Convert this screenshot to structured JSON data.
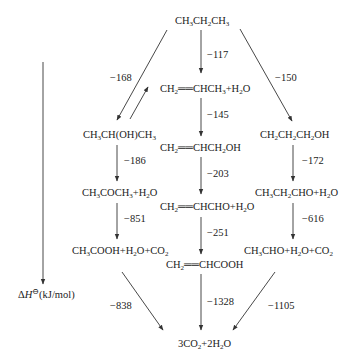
{
  "diagram": {
    "title": "",
    "axis_label": "ΔH⊖(kJ/mol)",
    "nodes": {
      "propane": "CH3CH2CH3",
      "propene": "CH2═CHCH3+H2O",
      "isopropanol": "CH3CH(OH)CH3",
      "allyl_alcohol": "CH2═CHCH2OH",
      "propanol": "CH2CH2CH2OH",
      "acetone": "CH3COCH3+H2O",
      "acrolein": "CH2═CHCHO+H2O",
      "propanal": "CH3CH2CHO+H2O",
      "acetic": "CH3COOH+H2O+CO2",
      "acrylic": "CH2═CHCOOH",
      "acetaldehyde": "CH3CHO+H2O+CO2",
      "final": "3CO2+2H2O"
    },
    "edges": [
      {
        "from": "propane",
        "to": "isopropanol",
        "value": "−168"
      },
      {
        "from": "propane",
        "to": "propene",
        "value": "−117"
      },
      {
        "from": "propane",
        "to": "propanol",
        "value": "−150"
      },
      {
        "from": "isopropanol",
        "to": "propene",
        "value": ""
      },
      {
        "from": "propene",
        "to": "allyl_alcohol",
        "value": "−145"
      },
      {
        "from": "isopropanol",
        "to": "acetone",
        "value": "−186"
      },
      {
        "from": "allyl_alcohol",
        "to": "acrolein",
        "value": "−203"
      },
      {
        "from": "propanol",
        "to": "propanal",
        "value": "−172"
      },
      {
        "from": "acetone",
        "to": "acetic",
        "value": "−851"
      },
      {
        "from": "acrolein",
        "to": "acrylic",
        "value": "−251"
      },
      {
        "from": "propanal",
        "to": "acetaldehyde",
        "value": "−616"
      },
      {
        "from": "acetic",
        "to": "final",
        "value": "−838"
      },
      {
        "from": "acrylic",
        "to": "final",
        "value": "−1328"
      },
      {
        "from": "acetaldehyde",
        "to": "final",
        "value": "−1105"
      }
    ]
  }
}
